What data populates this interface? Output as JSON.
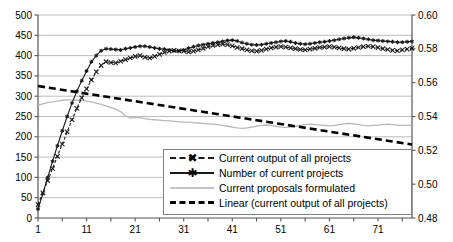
{
  "chart_data": {
    "type": "line",
    "title": "",
    "xlabel": "",
    "ylabel": "",
    "y2label": "",
    "xlim": [
      1,
      78
    ],
    "ylim": [
      0,
      500
    ],
    "y2lim": [
      0.48,
      0.6
    ],
    "grid": true,
    "legend_position": "inside-bottom-right",
    "x_ticks": [
      "1",
      "11",
      "21",
      "31",
      "41",
      "51",
      "61",
      "71"
    ],
    "x_tick_values": [
      1,
      11,
      21,
      31,
      41,
      51,
      61,
      71
    ],
    "y_ticks": [
      "0",
      "50",
      "100",
      "150",
      "200",
      "250",
      "300",
      "350",
      "400",
      "450",
      "500"
    ],
    "y_tick_values": [
      0,
      50,
      100,
      150,
      200,
      250,
      300,
      350,
      400,
      450,
      500
    ],
    "y2_ticks": [
      "0.48",
      "0.50",
      "0.52",
      "0.54",
      "0.56",
      "0.58",
      "0.60"
    ],
    "y2_tick_values": [
      0.48,
      0.5,
      0.52,
      0.54,
      0.56,
      0.58,
      0.6
    ],
    "x": [
      1,
      2,
      3,
      4,
      5,
      6,
      7,
      8,
      9,
      10,
      11,
      12,
      13,
      14,
      15,
      16,
      17,
      18,
      19,
      20,
      21,
      22,
      23,
      24,
      25,
      26,
      27,
      28,
      29,
      30,
      31,
      32,
      33,
      34,
      35,
      36,
      37,
      38,
      39,
      40,
      41,
      42,
      43,
      44,
      45,
      46,
      47,
      48,
      49,
      50,
      51,
      52,
      53,
      54,
      55,
      56,
      57,
      58,
      59,
      60,
      61,
      62,
      63,
      64,
      65,
      66,
      67,
      68,
      69,
      70,
      71,
      72,
      73,
      74,
      75,
      76,
      77,
      78
    ],
    "series": [
      {
        "name": "Number of current projects",
        "axis": "left",
        "style": "solid",
        "marker": "asterisk",
        "color": "#1a1a1a",
        "values": [
          22,
          60,
          100,
          140,
          178,
          215,
          250,
          283,
          312,
          338,
          362,
          385,
          400,
          412,
          417,
          416,
          415,
          414,
          417,
          419,
          421,
          423,
          423,
          421,
          419,
          417,
          416,
          414,
          412,
          411,
          414,
          418,
          422,
          425,
          427,
          429,
          431,
          433,
          435,
          437,
          438,
          436,
          432,
          429,
          427,
          426,
          427,
          429,
          431,
          433,
          435,
          436,
          434,
          431,
          429,
          428,
          429,
          431,
          433,
          434,
          436,
          438,
          440,
          442,
          444,
          445,
          444,
          442,
          440,
          438,
          437,
          436,
          435,
          434,
          433,
          433,
          434,
          435
        ]
      },
      {
        "name": "Current output of all projects",
        "axis": "left",
        "style": "dashed",
        "marker": "x",
        "color": "#1a1a1a",
        "values": [
          33,
          62,
          92,
          122,
          152,
          182,
          212,
          242,
          270,
          296,
          318,
          340,
          360,
          376,
          385,
          383,
          382,
          386,
          390,
          394,
          398,
          400,
          396,
          394,
          398,
          403,
          408,
          411,
          413,
          412,
          411,
          409,
          411,
          414,
          418,
          422,
          425,
          427,
          428,
          427,
          424,
          420,
          417,
          414,
          412,
          411,
          413,
          416,
          419,
          421,
          422,
          421,
          419,
          417,
          415,
          414,
          416,
          418,
          420,
          421,
          422,
          421,
          419,
          417,
          416,
          418,
          420,
          422,
          423,
          422,
          420,
          417,
          415,
          413,
          412,
          414,
          416,
          418
        ]
      },
      {
        "name": "Current proposals formulated",
        "axis": "left",
        "style": "solid-thin",
        "marker": "none",
        "color": "#b8b8b8",
        "values": [
          278,
          281,
          284,
          286,
          288,
          290,
          291,
          291,
          290,
          289,
          288,
          286,
          283,
          280,
          276,
          272,
          268,
          262,
          252,
          246,
          248,
          247,
          245,
          243,
          242,
          241,
          240,
          239,
          238,
          237,
          236,
          236,
          235,
          234,
          233,
          232,
          231,
          230,
          228,
          226,
          224,
          222,
          221,
          222,
          224,
          226,
          228,
          229,
          228,
          226,
          224,
          223,
          224,
          226,
          228,
          230,
          231,
          230,
          229,
          228,
          227,
          228,
          230,
          232,
          233,
          232,
          230,
          228,
          227,
          228,
          229,
          230,
          231,
          230,
          229,
          228,
          228,
          229
        ]
      },
      {
        "name": "Linear (current output of all projects)",
        "axis": "left",
        "style": "dashed-thick",
        "marker": "none",
        "color": "#000000",
        "trend": true,
        "values": [
          325,
          323,
          321,
          319,
          317,
          315,
          314,
          312,
          310,
          308,
          306,
          304,
          302,
          300,
          299,
          297,
          295,
          293,
          291,
          289,
          287,
          285,
          284,
          282,
          280,
          278,
          276,
          274,
          272,
          270,
          269,
          267,
          265,
          263,
          261,
          259,
          257,
          255,
          254,
          252,
          250,
          248,
          246,
          244,
          242,
          240,
          239,
          237,
          235,
          233,
          231,
          229,
          227,
          225,
          224,
          222,
          220,
          218,
          216,
          214,
          212,
          210,
          209,
          207,
          205,
          203,
          201,
          199,
          197,
          195,
          194,
          192,
          190,
          188,
          186,
          184,
          182,
          181
        ]
      }
    ]
  },
  "legend": {
    "items": [
      {
        "label": "Current output of all projects",
        "key": "dashed-x"
      },
      {
        "label": "Number of current projects",
        "key": "solid-asterisk"
      },
      {
        "label": "Current proposals formulated",
        "key": "solid-gray"
      },
      {
        "label": "Linear (current output of all projects)",
        "key": "dashed-thick"
      }
    ]
  },
  "colors": {
    "grid": "#a9a9a9",
    "axis": "#555555",
    "dark_series": "#1a1a1a",
    "gray_series": "#b8b8b8",
    "trend": "#000000",
    "legend_border": "#808080",
    "background": "#ffffff"
  }
}
